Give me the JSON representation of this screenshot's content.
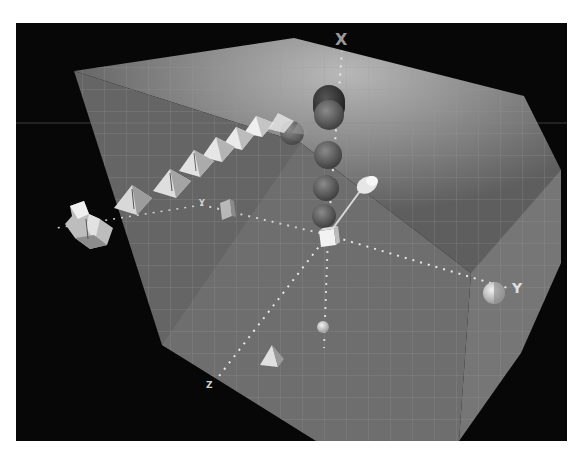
{
  "scene": {
    "description": "3D viewport with translucent gridded cube and coordinate axes",
    "background_color": "#070707",
    "cube_color": "#6a6a6a",
    "grid_color": "#9a9a9a",
    "axes": {
      "x": {
        "label": "X",
        "direction": "up"
      },
      "y": {
        "label": "Y",
        "direction": "right"
      },
      "z": {
        "label": "Z",
        "direction": "down-left"
      }
    },
    "objects": {
      "origin": "cube",
      "x_axis": [
        "sphere",
        "sphere",
        "sphere",
        "sphere",
        "sphere",
        "sphere"
      ],
      "y_axis": [
        "sphere",
        "box"
      ],
      "z_axis": [
        "tetrahedron",
        "small-sphere"
      ],
      "diagonal_row": [
        "pyramid",
        "pyramid",
        "pyramid",
        "pyramid",
        "pyramid",
        "pyramid",
        "pyramid",
        "pyramid"
      ],
      "far_left": "irregular-mesh",
      "diagonal_arm": "cylinder"
    }
  }
}
